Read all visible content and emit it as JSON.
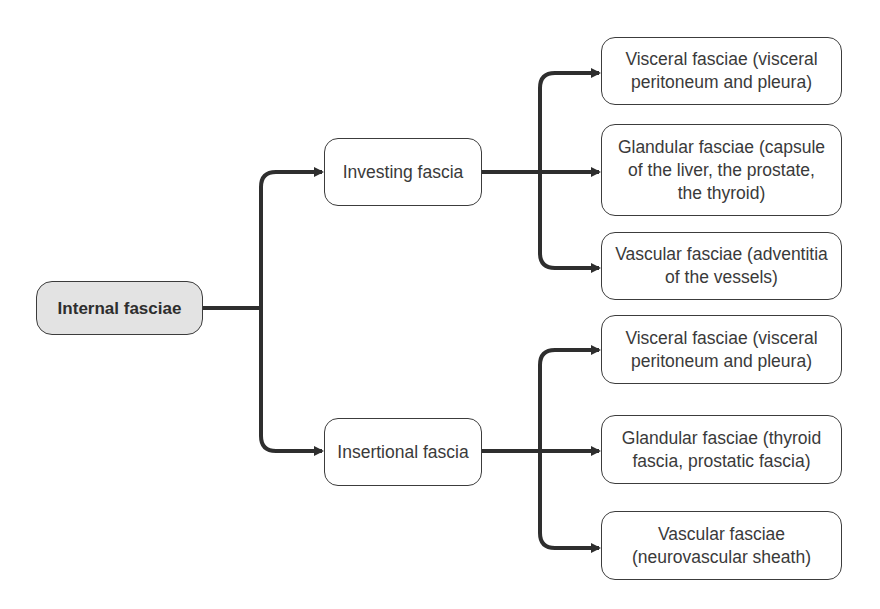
{
  "diagram": {
    "type": "tree",
    "root": {
      "id": "internal-fasciae",
      "label": "Internal fasciae",
      "fill": "#e3e3e3"
    },
    "branches": [
      {
        "id": "investing-fascia",
        "label": "Investing fascia",
        "children": [
          {
            "id": "visceral-1",
            "label": "Visceral fasciae (visceral peritoneum and pleura)"
          },
          {
            "id": "glandular-1",
            "label": "Glandular fasciae (capsule of the liver, the prostate, the thyroid)"
          },
          {
            "id": "vascular-1",
            "label": "Vascular fasciae (adventitia of the vessels)"
          }
        ]
      },
      {
        "id": "insertional-fascia",
        "label": "Insertional fascia",
        "children": [
          {
            "id": "visceral-2",
            "label": "Visceral fasciae (visceral peritoneum and pleura)"
          },
          {
            "id": "glandular-2",
            "label": "Glandular fasciae (thyroid fascia, prostatic fascia)"
          },
          {
            "id": "vascular-2",
            "label": "Vascular fasciae (neurovascular sheath)"
          }
        ]
      }
    ],
    "colors": {
      "line": "#2e2e2e",
      "border": "#3c3c3c",
      "text": "#3a3a3a",
      "root_fill": "#e3e3e3"
    }
  }
}
